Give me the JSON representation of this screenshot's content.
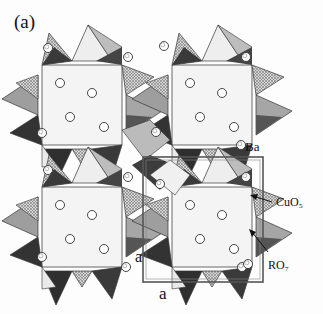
{
  "figure": {
    "panel_label": "(a)",
    "legend": {
      "ba": "Ba",
      "cuo5": "CuO₅",
      "ro7": "RO₇"
    },
    "axis_labels": {
      "a_vertical": "a",
      "a_horizontal": "a"
    },
    "colors": {
      "light_face": "#f2f2f2",
      "mid_face": "#a9a9a9",
      "hatch_face": "#c4c4c4",
      "dark_face": "#3c3c3c",
      "atom_fill": "#ffffff",
      "outline": "#222222"
    },
    "unit_cell": {
      "x": 143,
      "y": 157,
      "width": 120,
      "height": 125
    }
  }
}
